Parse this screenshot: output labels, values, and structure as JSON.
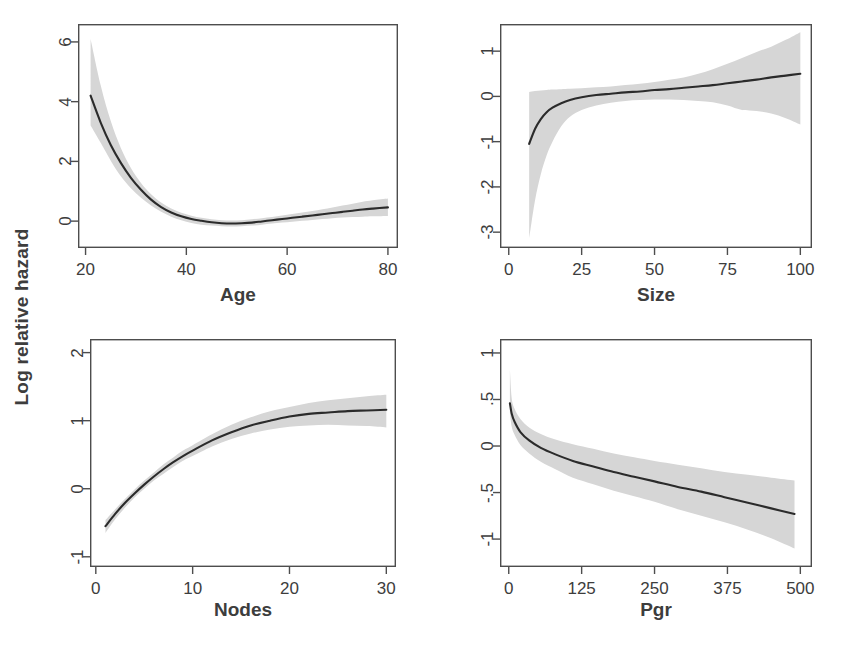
{
  "figure": {
    "shared_ylabel": "Log relative hazard",
    "layout": "2x2 grid of smoothed spline effect plots with 95% confidence bands",
    "band_color": "#d6d6d6",
    "line_color": "#2b2b2b",
    "frame_color": "#4d4d4d",
    "background": "#ffffff"
  },
  "chart_data": [
    {
      "type": "line",
      "title": "",
      "xlabel": "Age",
      "ylabel": "Log relative hazard",
      "xlim": [
        18.5,
        82
      ],
      "ylim": [
        -0.9,
        6.6
      ],
      "xticks": [
        20,
        40,
        60,
        80
      ],
      "xtick_labels": [
        "20",
        "40",
        "60",
        "80"
      ],
      "yticks": [
        0,
        2,
        4,
        6
      ],
      "ytick_labels": [
        "0",
        "2",
        "4",
        "6"
      ],
      "grid": false,
      "legend": "none",
      "x": [
        21,
        23,
        25,
        27,
        29,
        31,
        33,
        35,
        37,
        39,
        41,
        43,
        45,
        47,
        49,
        51,
        53,
        55,
        57,
        59,
        61,
        63,
        65,
        67,
        69,
        71,
        73,
        75,
        77,
        80
      ],
      "series": [
        {
          "name": "fit",
          "values": [
            4.2,
            3.3,
            2.55,
            1.95,
            1.45,
            1.05,
            0.72,
            0.47,
            0.29,
            0.16,
            0.07,
            0.01,
            -0.04,
            -0.07,
            -0.08,
            -0.07,
            -0.05,
            -0.01,
            0.03,
            0.07,
            0.11,
            0.15,
            0.19,
            0.23,
            0.27,
            0.31,
            0.35,
            0.39,
            0.42,
            0.46
          ]
        },
        {
          "name": "upper_ci",
          "values": [
            6.1,
            4.55,
            3.35,
            2.45,
            1.78,
            1.28,
            0.9,
            0.62,
            0.42,
            0.28,
            0.18,
            0.11,
            0.06,
            0.03,
            0.02,
            0.03,
            0.06,
            0.1,
            0.14,
            0.19,
            0.24,
            0.29,
            0.34,
            0.4,
            0.46,
            0.52,
            0.58,
            0.65,
            0.7,
            0.76
          ]
        },
        {
          "name": "lower_ci",
          "values": [
            3.2,
            2.62,
            2.02,
            1.5,
            1.1,
            0.78,
            0.52,
            0.31,
            0.15,
            0.03,
            -0.06,
            -0.12,
            -0.15,
            -0.17,
            -0.18,
            -0.17,
            -0.15,
            -0.12,
            -0.08,
            -0.05,
            -0.02,
            0.01,
            0.04,
            0.07,
            0.1,
            0.12,
            0.14,
            0.15,
            0.16,
            0.17
          ]
        }
      ]
    },
    {
      "type": "line",
      "title": "",
      "xlabel": "Size",
      "ylabel": "Log relative hazard",
      "xlim": [
        -3,
        104
      ],
      "ylim": [
        -3.35,
        1.6
      ],
      "xticks": [
        0,
        25,
        50,
        75,
        100
      ],
      "xtick_labels": [
        "0",
        "25",
        "50",
        "75",
        "100"
      ],
      "yticks": [
        -3,
        -2,
        -1,
        0,
        1
      ],
      "ytick_labels": [
        "-3",
        "-2",
        "-1",
        "0",
        "1"
      ],
      "grid": false,
      "legend": "none",
      "x": [
        7,
        9,
        11,
        13,
        15,
        18,
        21,
        25,
        30,
        35,
        40,
        45,
        50,
        55,
        60,
        65,
        70,
        75,
        80,
        85,
        90,
        95,
        100
      ],
      "series": [
        {
          "name": "fit",
          "values": [
            -1.05,
            -0.72,
            -0.5,
            -0.35,
            -0.25,
            -0.15,
            -0.08,
            -0.02,
            0.03,
            0.06,
            0.09,
            0.11,
            0.14,
            0.16,
            0.19,
            0.22,
            0.25,
            0.29,
            0.33,
            0.37,
            0.42,
            0.46,
            0.5
          ]
        },
        {
          "name": "upper_ci",
          "values": [
            0.1,
            0.12,
            0.13,
            0.14,
            0.15,
            0.16,
            0.17,
            0.18,
            0.2,
            0.22,
            0.25,
            0.28,
            0.32,
            0.37,
            0.42,
            0.5,
            0.6,
            0.72,
            0.85,
            0.98,
            1.1,
            1.25,
            1.42
          ]
        },
        {
          "name": "lower_ci",
          "values": [
            -3.15,
            -2.3,
            -1.72,
            -1.3,
            -1.0,
            -0.66,
            -0.45,
            -0.3,
            -0.2,
            -0.14,
            -0.1,
            -0.08,
            -0.07,
            -0.07,
            -0.08,
            -0.1,
            -0.13,
            -0.2,
            -0.3,
            -0.32,
            -0.38,
            -0.48,
            -0.62
          ]
        }
      ]
    },
    {
      "type": "line",
      "title": "",
      "xlabel": "Nodes",
      "ylabel": "Log relative hazard",
      "xlim": [
        -0.6,
        31
      ],
      "ylim": [
        -1.15,
        2.2
      ],
      "xticks": [
        0,
        10,
        20,
        30
      ],
      "xtick_labels": [
        "0",
        "10",
        "20",
        "30"
      ],
      "yticks": [
        -1,
        0,
        1,
        2
      ],
      "ytick_labels": [
        "-1",
        "0",
        "1",
        "2"
      ],
      "grid": false,
      "legend": "none",
      "x": [
        1,
        2,
        3,
        4,
        5,
        6,
        7,
        8,
        9,
        10,
        12,
        14,
        16,
        18,
        20,
        22,
        24,
        26,
        28,
        30
      ],
      "series": [
        {
          "name": "fit",
          "values": [
            -0.55,
            -0.37,
            -0.21,
            -0.07,
            0.06,
            0.18,
            0.29,
            0.39,
            0.48,
            0.56,
            0.71,
            0.83,
            0.93,
            1.0,
            1.06,
            1.1,
            1.12,
            1.14,
            1.15,
            1.16
          ]
        },
        {
          "name": "upper_ci",
          "values": [
            -0.46,
            -0.3,
            -0.15,
            -0.01,
            0.12,
            0.24,
            0.36,
            0.46,
            0.56,
            0.64,
            0.8,
            0.94,
            1.05,
            1.14,
            1.2,
            1.26,
            1.3,
            1.33,
            1.36,
            1.38
          ]
        },
        {
          "name": "lower_ci",
          "values": [
            -0.65,
            -0.45,
            -0.28,
            -0.13,
            0.0,
            0.12,
            0.22,
            0.32,
            0.41,
            0.48,
            0.62,
            0.73,
            0.81,
            0.87,
            0.91,
            0.93,
            0.94,
            0.93,
            0.92,
            0.9
          ]
        }
      ]
    },
    {
      "type": "line",
      "title": "",
      "xlabel": "Pgr",
      "ylabel": "Log relative hazard",
      "xlim": [
        -15,
        520
      ],
      "ylim": [
        -1.3,
        1.15
      ],
      "xticks": [
        0,
        125,
        250,
        375,
        500
      ],
      "xtick_labels": [
        "0",
        "125",
        "250",
        "375",
        "500"
      ],
      "yticks": [
        -1,
        -0.5,
        0,
        0.5,
        1
      ],
      "ytick_labels": [
        "-1",
        "-.5",
        "0",
        ".5",
        "1"
      ],
      "grid": false,
      "legend": "none",
      "x": [
        2,
        5,
        10,
        20,
        35,
        55,
        80,
        110,
        145,
        180,
        215,
        250,
        290,
        330,
        370,
        410,
        450,
        490
      ],
      "series": [
        {
          "name": "fit",
          "values": [
            0.46,
            0.35,
            0.26,
            0.15,
            0.06,
            -0.02,
            -0.09,
            -0.16,
            -0.22,
            -0.28,
            -0.33,
            -0.38,
            -0.44,
            -0.49,
            -0.55,
            -0.61,
            -0.67,
            -0.73
          ]
        },
        {
          "name": "upper_ci",
          "values": [
            0.82,
            0.52,
            0.4,
            0.29,
            0.2,
            0.13,
            0.07,
            0.02,
            -0.03,
            -0.08,
            -0.12,
            -0.16,
            -0.2,
            -0.24,
            -0.28,
            -0.31,
            -0.34,
            -0.37
          ]
        },
        {
          "name": "lower_ci",
          "values": [
            0.36,
            0.21,
            0.12,
            0.01,
            -0.08,
            -0.17,
            -0.25,
            -0.34,
            -0.41,
            -0.48,
            -0.54,
            -0.6,
            -0.68,
            -0.75,
            -0.82,
            -0.9,
            -0.99,
            -1.1
          ]
        }
      ]
    }
  ],
  "panels": [
    {
      "name": "age-panel",
      "xlabel": "Age",
      "xtick_labels": [
        "20",
        "40",
        "60",
        "80"
      ],
      "ytick_labels": [
        "0",
        "2",
        "4",
        "6"
      ]
    },
    {
      "name": "size-panel",
      "xlabel": "Size",
      "xtick_labels": [
        "0",
        "25",
        "50",
        "75",
        "100"
      ],
      "ytick_labels": [
        "-3",
        "-2",
        "-1",
        "0",
        "1"
      ]
    },
    {
      "name": "nodes-panel",
      "xlabel": "Nodes",
      "xtick_labels": [
        "0",
        "10",
        "20",
        "30"
      ],
      "ytick_labels": [
        "-1",
        "0",
        "1",
        "2"
      ]
    },
    {
      "name": "pgr-panel",
      "xlabel": "Pgr",
      "xtick_labels": [
        "0",
        "125",
        "250",
        "375",
        "500"
      ],
      "ytick_labels": [
        "-1",
        "-.5",
        "0",
        ".5",
        "1"
      ]
    }
  ]
}
